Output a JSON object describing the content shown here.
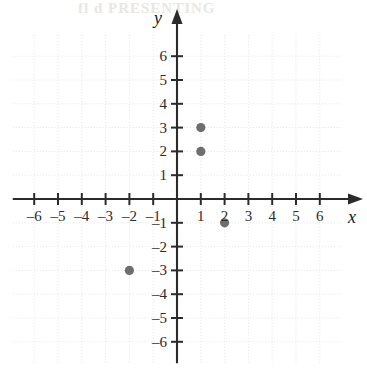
{
  "artifact": {
    "text": "fl  d  PRESENTING"
  },
  "chart_data": {
    "type": "scatter",
    "title": "",
    "xlabel": "x",
    "ylabel": "y",
    "xlim": [
      -6.9,
      6.9
    ],
    "ylim": [
      -6.9,
      6.9
    ],
    "grid": true,
    "grid_step": 1,
    "legend": "none",
    "x_ticks": [
      -6,
      -5,
      -4,
      -3,
      -2,
      -1,
      1,
      2,
      3,
      4,
      5,
      6
    ],
    "y_ticks": [
      6,
      5,
      4,
      3,
      2,
      1,
      -1,
      -2,
      -3,
      -4,
      -5,
      -6
    ],
    "x_tick_labels": [
      "–6",
      "–5",
      "–4",
      "–3",
      "–2",
      "–1",
      "1",
      "2",
      "3",
      "4",
      "5",
      "6"
    ],
    "y_tick_labels": [
      "6",
      "5",
      "4",
      "3",
      "2",
      "1",
      "–1",
      "–2",
      "–3",
      "–4",
      "–5",
      "–6"
    ],
    "points": [
      {
        "x": 1,
        "y": 3,
        "label": "(1, 3)"
      },
      {
        "x": 1,
        "y": 2,
        "label": "(1, 2)"
      },
      {
        "x": 2,
        "y": -1,
        "label": "(2, –1)"
      },
      {
        "x": -2,
        "y": -3,
        "label": "(–2, –3)"
      }
    ],
    "point_color": "#6e6e6e",
    "axis_color": "#2b2b2b",
    "grid_color": "#e2e2e2"
  }
}
